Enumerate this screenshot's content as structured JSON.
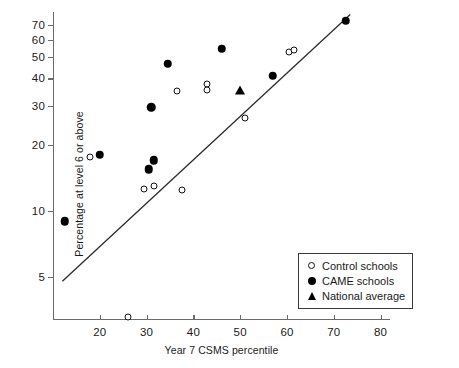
{
  "chart_data": {
    "type": "scatter",
    "title": "",
    "xlabel": "Year 7 CSMS percentile",
    "ylabel": "Percentage at level 6 or above",
    "xlim": [
      10,
      82
    ],
    "ylim": [
      3.2,
      80
    ],
    "yscale": "log",
    "xscale": "linear",
    "grid": false,
    "xticks": [
      20,
      30,
      40,
      50,
      60,
      70,
      80
    ],
    "yticks": [
      5,
      10,
      20,
      30,
      40,
      50,
      60,
      70
    ],
    "legend_position": "bottom-right",
    "series": [
      {
        "name": "Control schools",
        "marker": "open-circle",
        "points": [
          {
            "x": 18.0,
            "y": 17.5
          },
          {
            "x": 26.0,
            "y": 3.3
          },
          {
            "x": 29.5,
            "y": 12.6
          },
          {
            "x": 31.5,
            "y": 13.0
          },
          {
            "x": 37.5,
            "y": 12.5
          },
          {
            "x": 36.5,
            "y": 35.0
          },
          {
            "x": 43.0,
            "y": 37.5
          },
          {
            "x": 43.0,
            "y": 35.5
          },
          {
            "x": 51.0,
            "y": 26.5
          },
          {
            "x": 60.5,
            "y": 52.5
          },
          {
            "x": 61.5,
            "y": 53.5
          }
        ]
      },
      {
        "name": "CAME schools",
        "marker": "filled-circle",
        "points": [
          {
            "x": 12.5,
            "y": 9.0
          },
          {
            "x": 20.0,
            "y": 18.0
          },
          {
            "x": 30.5,
            "y": 15.5
          },
          {
            "x": 31.5,
            "y": 17.0
          },
          {
            "x": 31.0,
            "y": 29.5
          },
          {
            "x": 34.5,
            "y": 46.5
          },
          {
            "x": 46.0,
            "y": 54.5
          },
          {
            "x": 57.0,
            "y": 41.0
          },
          {
            "x": 72.5,
            "y": 73.0
          }
        ]
      },
      {
        "name": "National average",
        "marker": "filled-triangle",
        "points": [
          {
            "x": 50.0,
            "y": 35.5
          }
        ]
      }
    ],
    "trendline": {
      "name": "fitted regression line",
      "x_start": 12.0,
      "y_start": 4.8,
      "x_end": 73.5,
      "y_end": 78.0
    }
  },
  "axes": {
    "y_title": "Percentage at level 6 or above",
    "x_title": "Year 7 CSMS percentile",
    "y_tick_labels": [
      "70",
      "60",
      "50",
      "40",
      "30",
      "20",
      "10",
      "5"
    ],
    "x_tick_labels": [
      "20",
      "30",
      "40",
      "50",
      "60",
      "70",
      "80"
    ]
  },
  "legend": {
    "items": [
      {
        "label": "Control schools",
        "marker": "open-circle-icon"
      },
      {
        "label": "CAME schools",
        "marker": "filled-circle-icon"
      },
      {
        "label": "National average",
        "marker": "filled-triangle-icon"
      }
    ]
  }
}
